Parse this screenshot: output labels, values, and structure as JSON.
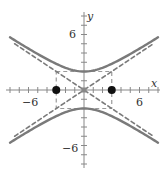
{
  "chart_data": {
    "type": "line",
    "title": "",
    "xlabel": "x",
    "ylabel": "y",
    "xlim": [
      -8,
      8
    ],
    "ylim": [
      -8,
      8
    ],
    "x_ticks_labeled": [
      -6,
      6
    ],
    "y_ticks_labeled": [
      6,
      -6
    ],
    "tick_step": 1,
    "grid": false,
    "series": [
      {
        "name": "hyperbola upper branch",
        "style": "solid",
        "color": "#7a7a7a",
        "equation": "y = 2*sqrt(1 + x^2/9)",
        "x_range": [
          -8,
          8
        ]
      },
      {
        "name": "hyperbola lower branch",
        "style": "solid",
        "color": "#7a7a7a",
        "equation": "y = -2*sqrt(1 + x^2/9)",
        "x_range": [
          -8,
          8
        ]
      },
      {
        "name": "asymptote positive",
        "style": "dashed",
        "color": "#7a7a7a",
        "equation": "y = (2/3)x",
        "x_range": [
          -7.5,
          7.5
        ]
      },
      {
        "name": "asymptote negative",
        "style": "dashed",
        "color": "#7a7a7a",
        "equation": "y = -(2/3)x",
        "x_range": [
          -7.5,
          7.5
        ]
      },
      {
        "name": "fundamental rectangle",
        "style": "dashed",
        "color": "#9a9a9a",
        "corners": [
          [
            -3,
            2
          ],
          [
            3,
            2
          ],
          [
            3,
            -2
          ],
          [
            -3,
            -2
          ]
        ]
      }
    ],
    "points": [
      {
        "x": -3,
        "y": 0,
        "color": "#111111",
        "size": "large"
      },
      {
        "x": 3,
        "y": 0,
        "color": "#111111",
        "size": "large"
      },
      {
        "x": 0,
        "y": 0,
        "color": "#888888",
        "size": "small",
        "shape": "square"
      }
    ]
  },
  "labels": {
    "x_axis": "x",
    "y_axis": "y",
    "x_neg": "−6",
    "x_pos": "6",
    "y_pos": "6",
    "y_neg": "−6"
  },
  "colors": {
    "curve": "#7a7a7a",
    "axis": "#888888",
    "point": "#111111"
  }
}
